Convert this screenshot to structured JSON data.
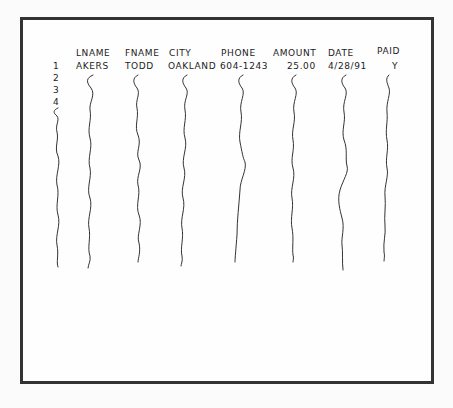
{
  "table": {
    "columns": [
      "LNAME",
      "FNAME",
      "CITY",
      "PHONE",
      "AMOUNT",
      "DATE",
      "PAID"
    ],
    "row_numbers": [
      "1",
      "2",
      "3",
      "4",
      "5"
    ],
    "rows": [
      {
        "LNAME": "AKERS",
        "FNAME": "TODD",
        "CITY": "OAKLAND",
        "PHONE": "604-1243",
        "AMOUNT": "25.00",
        "DATE": "4/28/91",
        "PAID": "Y"
      }
    ],
    "continuation": "wavy-line (more records)"
  },
  "colors": {
    "ink": "#222222",
    "frame": "#333333",
    "paper": "#fefefe"
  }
}
